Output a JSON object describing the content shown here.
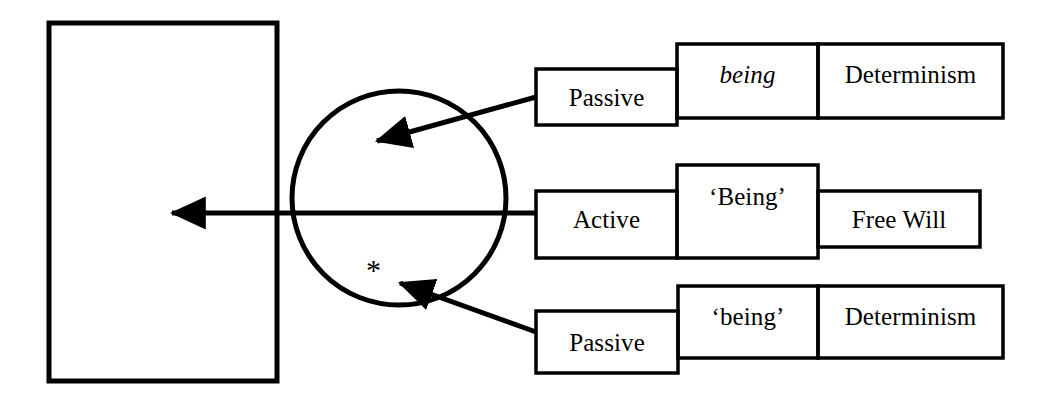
{
  "diagram": {
    "title_text": "",
    "stroke_color": "#000000",
    "background_color": "#ffffff",
    "target_panel": {
      "name": "empty-target-rectangle",
      "text": ""
    },
    "circle": {
      "name": "central-circle",
      "text": "",
      "marker": "*"
    },
    "rows": [
      {
        "id": "row-top",
        "voice": "Passive",
        "term": "being",
        "term_style": "italic",
        "outcome": "Determinism"
      },
      {
        "id": "row-middle",
        "voice": "Active",
        "term": "‘Being’",
        "term_style": "roman-quoted",
        "outcome": "Free Will"
      },
      {
        "id": "row-bottom",
        "voice": "Passive",
        "term": "‘being’",
        "term_style": "roman-quoted",
        "outcome": "Determinism"
      }
    ]
  }
}
